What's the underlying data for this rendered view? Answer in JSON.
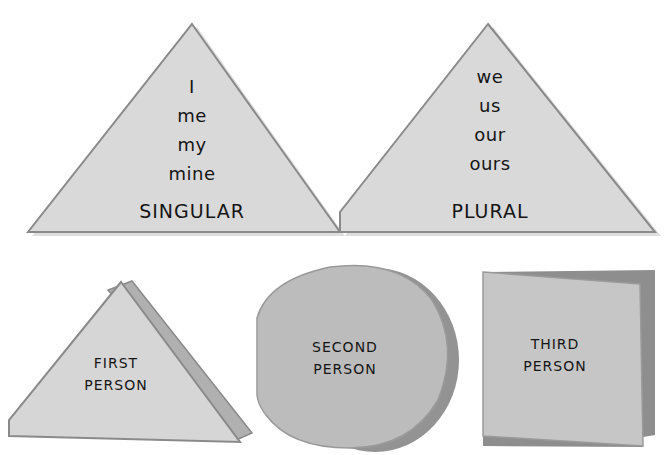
{
  "colors": {
    "background": "#ffffff",
    "face_light": "#d9d9d9",
    "face_mid": "#c4c4c4",
    "face_dark": "#a8a8a8",
    "shadow": "#8e8e8e",
    "edge": "#8a8a8a",
    "text": "#151515"
  },
  "singular": {
    "pronouns": [
      "I",
      "me",
      "my",
      "mine"
    ],
    "label": "SINGULAR"
  },
  "plural": {
    "pronouns": [
      "we",
      "us",
      "our",
      "ours"
    ],
    "label": "PLURAL"
  },
  "first_person": {
    "line1": "FIRST",
    "line2": "PERSON",
    "shape": "triangle"
  },
  "second_person": {
    "line1": "SECOND",
    "line2": "PERSON",
    "shape": "circle"
  },
  "third_person": {
    "line1": "THIRD",
    "line2": "PERSON",
    "shape": "square"
  }
}
